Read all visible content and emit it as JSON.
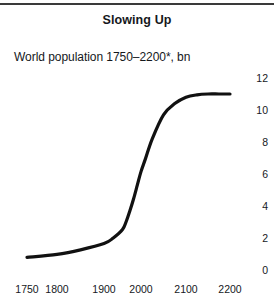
{
  "figure": {
    "title": "Slowing Up",
    "subtitle": "World population 1750–2200*, bn"
  },
  "chart_data": {
    "type": "line",
    "title": "Slowing Up",
    "subtitle": "World population 1750–2200*, bn",
    "xlabel": "",
    "ylabel": "bn",
    "ylim": [
      0,
      12
    ],
    "xlim": [
      1750,
      2200
    ],
    "grid": false,
    "legend": null,
    "y_ticks": [
      "12",
      "10",
      "8",
      "6",
      "4",
      "2",
      "0"
    ],
    "y_tick_values": [
      12,
      10,
      8,
      6,
      4,
      2,
      0
    ],
    "y_axis_position": "right",
    "x_ticks": [
      "1750",
      "1800",
      "1900",
      "2000",
      "2100",
      "2200"
    ],
    "x_tick_values": [
      1750,
      1800,
      1900,
      2000,
      2100,
      2200
    ],
    "series": [
      {
        "name": "World population",
        "color": "#111111",
        "x": [
          1750,
          1800,
          1850,
          1900,
          1925,
          1950,
          1960,
          1970,
          1980,
          1990,
          2000,
          2010,
          2025,
          2050,
          2075,
          2100,
          2125,
          2150,
          2175,
          2200
        ],
        "values": [
          0.79,
          0.98,
          1.26,
          1.65,
          2.0,
          2.53,
          3.03,
          3.7,
          4.45,
          5.3,
          6.15,
          6.96,
          8.2,
          9.7,
          10.4,
          10.8,
          10.95,
          11.0,
          11.0,
          11.0
        ]
      }
    ],
    "annotations": [
      {
        "text": "*forecast indicated by asterisk in subtitle"
      }
    ]
  }
}
